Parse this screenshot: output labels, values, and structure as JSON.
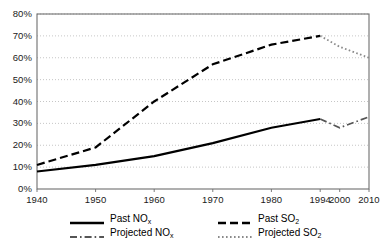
{
  "chart_data": {
    "type": "line",
    "title": "",
    "xlabel": "",
    "ylabel": "",
    "x": [
      1940,
      1950,
      1960,
      1970,
      1980,
      1994,
      2000,
      2010
    ],
    "xtick_labels": [
      "1940",
      "1950",
      "1960",
      "1970",
      "1980",
      "1994",
      "2000",
      "2010"
    ],
    "ytick_labels": [
      "0%",
      "10%",
      "20%",
      "30%",
      "40%",
      "50%",
      "60%",
      "70%",
      "80%"
    ],
    "ytick_values": [
      0,
      10,
      20,
      30,
      40,
      50,
      60,
      70,
      80
    ],
    "ylim": [
      0,
      80
    ],
    "grid": "horizontal-dotted",
    "legend_position": "bottom",
    "series": [
      {
        "name": "Past NOₓ",
        "label_main": "Past NO",
        "label_sub": "x",
        "style": "solid",
        "color": "#000000",
        "x": [
          1940,
          1950,
          1960,
          1970,
          1980,
          1994
        ],
        "values": [
          8,
          11,
          15,
          21,
          28,
          32
        ]
      },
      {
        "name": "Projected NOₓ",
        "label_main": "Projected NO",
        "label_sub": "x",
        "style": "dash-dot",
        "color": "#555555",
        "x": [
          1994,
          2000,
          2010
        ],
        "values": [
          32,
          28,
          33
        ]
      },
      {
        "name": "Past SO₂",
        "label_main": "Past SO",
        "label_sub": "2",
        "style": "dashed",
        "color": "#000000",
        "x": [
          1940,
          1950,
          1960,
          1970,
          1980,
          1994
        ],
        "values": [
          11,
          19,
          40,
          57,
          66,
          70
        ]
      },
      {
        "name": "Projected SO₂",
        "label_main": "Projected SO",
        "label_sub": "2",
        "style": "dotted",
        "color": "#8a8a8a",
        "x": [
          1994,
          2000,
          2010
        ],
        "values": [
          70,
          65,
          60
        ]
      }
    ],
    "colors": {
      "axis": "#6e6e6e",
      "grid": "#b8b8b8",
      "text": "#000000",
      "background": "#ffffff"
    }
  }
}
